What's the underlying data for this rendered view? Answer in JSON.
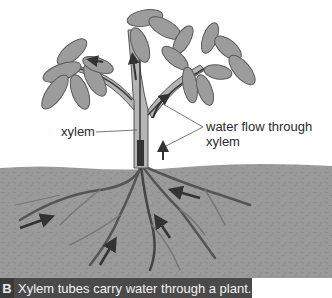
{
  "figure": {
    "badge": "B",
    "caption": "Xylem tubes carry water through a plant.",
    "labels": {
      "xylem": "xylem",
      "water_flow": "water flow through xylem"
    },
    "colors": {
      "soil": "#9a9a9a",
      "soil_texture": "#8a8a8a",
      "leaf_fill": "#9c9c9c",
      "leaf_stroke": "#5a5a5a",
      "stem": "#b5b5b5",
      "xylem_line": "#3a3a3a",
      "arrow": "#333333",
      "caption_bg": "#4a4a4a",
      "caption_text": "#f2f2f2"
    }
  }
}
